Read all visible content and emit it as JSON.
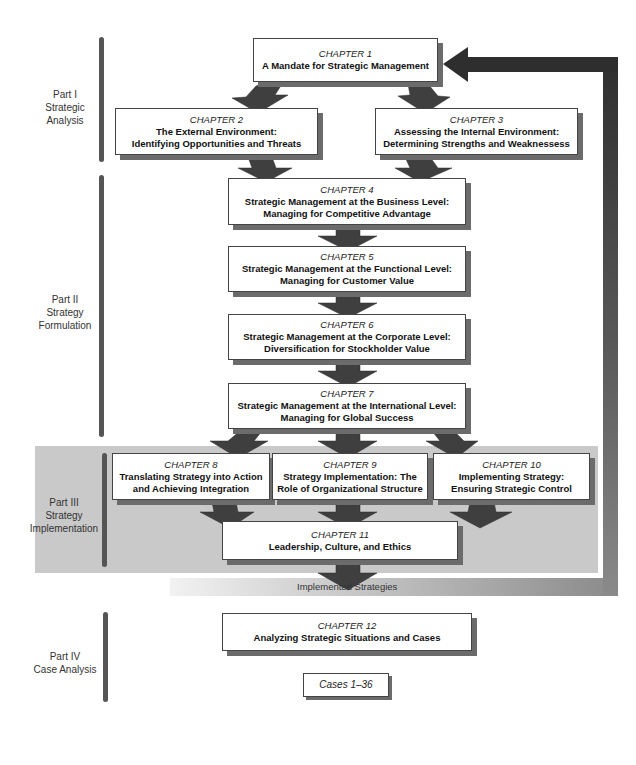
{
  "parts": [
    {
      "id": "part-1",
      "label_lines": [
        "Part I",
        "Strategic",
        "Analysis"
      ]
    },
    {
      "id": "part-2",
      "label_lines": [
        "Part II",
        "Strategy",
        "Formulation"
      ]
    },
    {
      "id": "part-3",
      "label_lines": [
        "Part III",
        "Strategy",
        "Implementation"
      ]
    },
    {
      "id": "part-4",
      "label_lines": [
        "Part IV",
        "Case Analysis"
      ]
    }
  ],
  "chapters": {
    "ch1": {
      "label": "CHAPTER 1",
      "title_lines": [
        "A Mandate for Strategic Management"
      ]
    },
    "ch2": {
      "label": "CHAPTER 2",
      "title_lines": [
        "The External Environment:",
        "Identifying Opportunities and Threats"
      ]
    },
    "ch3": {
      "label": "CHAPTER 3",
      "title_lines": [
        "Assessing the Internal Environment:",
        "Determining Strengths and Weaknessess"
      ]
    },
    "ch4": {
      "label": "CHAPTER 4",
      "title_lines": [
        "Strategic Management at the Business Level:",
        "Managing for Competitive Advantage"
      ]
    },
    "ch5": {
      "label": "CHAPTER 5",
      "title_lines": [
        "Strategic Management at the Functional Level:",
        "Managing for Customer Value"
      ]
    },
    "ch6": {
      "label": "CHAPTER 6",
      "title_lines": [
        "Strategic Management at the Corporate Level:",
        "Diversification for Stockholder Value"
      ]
    },
    "ch7": {
      "label": "CHAPTER 7",
      "title_lines": [
        "Strategic Management at the International Level:",
        "Managing for Global Success"
      ]
    },
    "ch8": {
      "label": "CHAPTER 8",
      "title_lines": [
        "Translating Strategy into Action",
        "and Achieving Integration"
      ]
    },
    "ch9": {
      "label": "CHAPTER 9",
      "title_lines": [
        "Strategy Implementation: The",
        "Role of Organizational Structure"
      ]
    },
    "ch10": {
      "label": "CHAPTER 10",
      "title_lines": [
        "Implementing Strategy:",
        "Ensuring Strategic Control"
      ]
    },
    "ch11": {
      "label": "CHAPTER 11",
      "title_lines": [
        "Leadership, Culture, and Ethics"
      ]
    },
    "ch12": {
      "label": "CHAPTER 12",
      "title_lines": [
        "Analyzing Strategic Situations and Cases"
      ]
    }
  },
  "cases": {
    "label": "Cases 1–36"
  },
  "feedback": {
    "label": "Implemented Strategies"
  },
  "colors": {
    "band": "#c9c9c9",
    "arrow": "#3a3a3a",
    "feedback_dark": "#2e2e2e",
    "feedback_light": "#8a8a8a",
    "bar": "#555555",
    "shadow": "#6b6b6b"
  }
}
